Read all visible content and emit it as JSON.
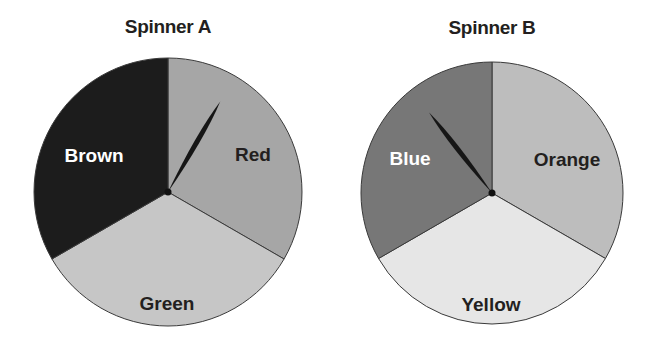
{
  "spinners": [
    {
      "title": "Spinner A",
      "center": [
        168,
        192
      ],
      "radius": 134,
      "sections": [
        {
          "label": "Red",
          "color": "#a6a6a6",
          "text_color": "#231f20",
          "start_deg": 0,
          "end_deg": 120,
          "label_pos": [
            253,
            154
          ]
        },
        {
          "label": "Green",
          "color": "#c6c6c6",
          "text_color": "#231f20",
          "start_deg": 120,
          "end_deg": 240,
          "label_pos": [
            167,
            303
          ]
        },
        {
          "label": "Brown",
          "color": "#1c1c1c",
          "text_color": "#ffffff",
          "start_deg": 240,
          "end_deg": 360,
          "label_pos": [
            94,
            155
          ]
        }
      ],
      "pointer_angle_deg": 30,
      "pointer_lands_on": "Red"
    },
    {
      "title": "Spinner B",
      "center": [
        492,
        193
      ],
      "radius": 131,
      "sections": [
        {
          "label": "Orange",
          "color": "#bdbdbd",
          "text_color": "#231f20",
          "start_deg": 0,
          "end_deg": 120,
          "label_pos": [
            567,
            159
          ]
        },
        {
          "label": "Yellow",
          "color": "#e6e6e6",
          "text_color": "#231f20",
          "start_deg": 120,
          "end_deg": 240,
          "label_pos": [
            491,
            304
          ]
        },
        {
          "label": "Blue",
          "color": "#777777",
          "text_color": "#ffffff",
          "start_deg": 240,
          "end_deg": 360,
          "label_pos": [
            410,
            158
          ]
        }
      ],
      "pointer_angle_deg": -38,
      "pointer_lands_on": "Blue"
    }
  ]
}
